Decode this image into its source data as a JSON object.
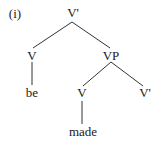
{
  "example_label": "(i)",
  "tree": {
    "root": "V'",
    "left_head": "V",
    "left_word": "be",
    "phrase": "VP",
    "inner_head": "V",
    "inner_word": "made",
    "inner_bar": "V'"
  },
  "colors": {
    "ink": "#1a1a1a",
    "line": "#333333",
    "background": "#ffffff"
  }
}
